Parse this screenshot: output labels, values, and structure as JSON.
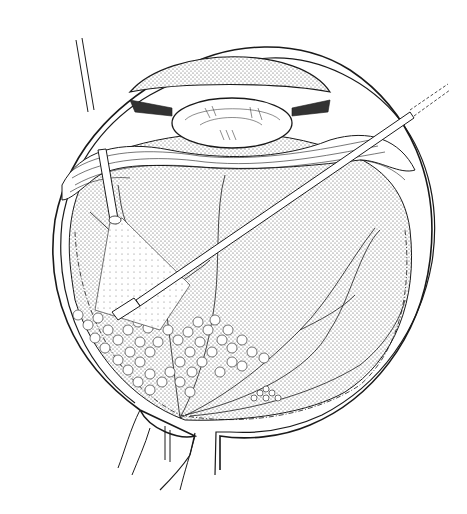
{
  "figure": {
    "title": "",
    "background": "#ffffff",
    "ink": "#1a1a1a",
    "stipple": "#555555",
    "parts": {
      "cornea": "cornea",
      "lens": "lens",
      "ciliary_body": "ciliary-body",
      "vitreous": "vitreous-cavity",
      "retina": "retina",
      "optic_nerve": "optic-nerve",
      "light_pipe": "endoilluminator",
      "laser_probe": "laser-probe",
      "laser_spots": "laser-burns",
      "macula": "fovea"
    }
  }
}
